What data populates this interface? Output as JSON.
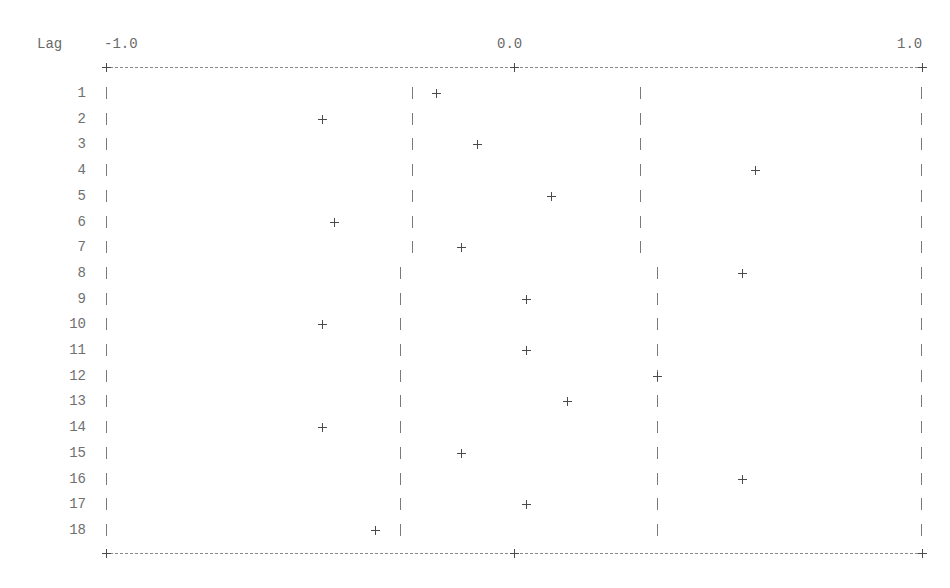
{
  "chart_data": {
    "type": "scatter",
    "title": "",
    "style": "text-based correlogram (ASCII plot)",
    "xlabel": "",
    "ylabel": "Lag",
    "x_tick_labels": [
      "-1.0",
      "0.0",
      "1.0"
    ],
    "x_ticks": [
      -1.0,
      0.0,
      1.0
    ],
    "xlim": [
      -1.0,
      1.0
    ],
    "grid": false,
    "legend": null,
    "lags": [
      1,
      2,
      3,
      4,
      5,
      6,
      7,
      8,
      9,
      10,
      11,
      12,
      13,
      14,
      15,
      16,
      17,
      18
    ],
    "values": [
      -0.19,
      -0.47,
      -0.09,
      0.59,
      0.09,
      -0.44,
      -0.13,
      0.56,
      0.03,
      -0.47,
      0.03,
      0.35,
      0.13,
      -0.47,
      -0.13,
      0.56,
      0.03,
      -0.34
    ],
    "confidence_bands": {
      "lower": [
        -0.25,
        -0.25,
        -0.25,
        -0.25,
        -0.25,
        -0.25,
        -0.25,
        -0.28,
        -0.28,
        -0.28,
        -0.28,
        -0.28,
        -0.28,
        -0.28,
        -0.28,
        -0.28,
        -0.28,
        -0.28
      ],
      "upper": [
        0.31,
        0.31,
        0.31,
        0.31,
        0.31,
        0.31,
        0.31,
        0.35,
        0.35,
        0.35,
        0.35,
        0.35,
        0.35,
        0.35,
        0.35,
        0.35,
        0.35,
        0.35
      ]
    },
    "markers": {
      "point": "+",
      "band": "|",
      "frame": "|"
    }
  },
  "labels": {
    "lag_header": "Lag",
    "tick_min": "-1.0",
    "tick_mid": "0.0",
    "tick_max": "1.0"
  },
  "colors": {
    "text": "#6a6a6a",
    "marker": "#4a4a4a",
    "frame": "#8a8a8a"
  }
}
